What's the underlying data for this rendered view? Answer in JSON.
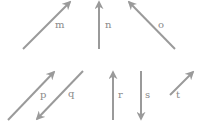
{
  "diagram": {
    "colors": {
      "arrow": "#9a9a9a",
      "label": "#8a8a8a",
      "background": "#ffffff"
    },
    "vectors": [
      {
        "id": "m",
        "label": "m",
        "x1": 23,
        "y1": 49,
        "x2": 70,
        "y2": 2,
        "lx": 55,
        "ly": 28
      },
      {
        "id": "n",
        "label": "n",
        "x1": 99,
        "y1": 49,
        "x2": 99,
        "y2": 2,
        "lx": 105,
        "ly": 28
      },
      {
        "id": "o",
        "label": "o",
        "x1": 175,
        "y1": 49,
        "x2": 129,
        "y2": 2,
        "lx": 158,
        "ly": 28
      },
      {
        "id": "p",
        "label": "p",
        "x1": 8,
        "y1": 120,
        "x2": 54,
        "y2": 72,
        "lx": 40,
        "ly": 98
      },
      {
        "id": "q",
        "label": "q",
        "x1": 83,
        "y1": 71,
        "x2": 37,
        "y2": 119,
        "lx": 68,
        "ly": 97
      },
      {
        "id": "r",
        "label": "r",
        "x1": 113,
        "y1": 120,
        "x2": 113,
        "y2": 72,
        "lx": 118,
        "ly": 98
      },
      {
        "id": "s",
        "label": "s",
        "x1": 141,
        "y1": 71,
        "x2": 141,
        "y2": 119,
        "lx": 145,
        "ly": 98
      },
      {
        "id": "t",
        "label": "t",
        "x1": 170,
        "y1": 95,
        "x2": 193,
        "y2": 72,
        "lx": 176,
        "ly": 98
      }
    ]
  }
}
